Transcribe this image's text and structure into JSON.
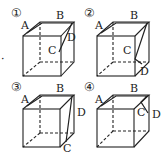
{
  "figure": {
    "panels": [
      {
        "number": "①",
        "labels": {
          "A": "A",
          "B": "B",
          "C": "C",
          "D": "D"
        }
      },
      {
        "number": "②",
        "labels": {
          "A": "A",
          "B": "B",
          "C": "C",
          "D": "D"
        }
      },
      {
        "number": "③",
        "labels": {
          "A": "A",
          "B": "B",
          "C": "C",
          "D": "D"
        }
      },
      {
        "number": "④",
        "labels": {
          "A": "A",
          "B": "B",
          "C": "C",
          "D": "D"
        }
      }
    ],
    "stray_marks": {
      "left_dot": "·",
      "left_d": "D"
    }
  }
}
